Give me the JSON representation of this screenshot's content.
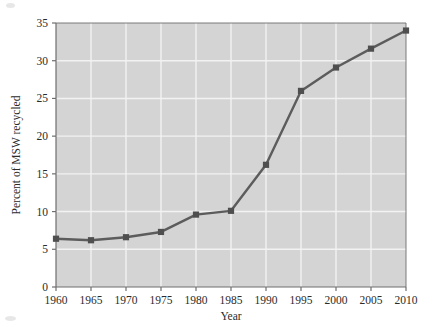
{
  "chart_data": {
    "type": "line",
    "title": "",
    "subtitle": "",
    "xlabel": "Year",
    "ylabel": "Percent of MSW recycled",
    "x": [
      1960,
      1965,
      1970,
      1975,
      1980,
      1985,
      1990,
      1995,
      2000,
      2005,
      2010
    ],
    "values": [
      6.4,
      6.2,
      6.6,
      7.3,
      9.6,
      10.1,
      16.2,
      26.0,
      29.1,
      31.6,
      34.0
    ],
    "series": [
      {
        "name": "Percent of MSW recycled",
        "values": [
          6.4,
          6.2,
          6.6,
          7.3,
          9.6,
          10.1,
          16.2,
          26.0,
          29.1,
          31.6,
          34.0
        ]
      }
    ],
    "categories": [
      "1960",
      "1965",
      "1970",
      "1975",
      "1980",
      "1985",
      "1990",
      "1995",
      "2000",
      "2005",
      "2010"
    ],
    "xlim": [
      1960,
      2010
    ],
    "ylim": [
      0,
      35
    ],
    "xticks": [
      1960,
      1965,
      1970,
      1975,
      1980,
      1985,
      1990,
      1995,
      2000,
      2005,
      2010
    ],
    "yticks": [
      0,
      5,
      10,
      15,
      20,
      25,
      30,
      35
    ],
    "xtick_labels": [
      "1960",
      "1965",
      "1970",
      "1975",
      "1980",
      "1985",
      "1990",
      "1995",
      "2000",
      "2005",
      "2010"
    ],
    "ytick_labels": [
      "0",
      "5",
      "10",
      "15",
      "20",
      "25",
      "30",
      "35"
    ],
    "grid": true,
    "grid_axis": "both",
    "legend": false,
    "legend_position": "none",
    "marker": "square",
    "annotations": []
  },
  "style": {
    "plot_background": "#d4d4d4",
    "page_background": "#ffffff",
    "grid_color": "#f2f2f2",
    "line_color": "#5c5c5c",
    "marker_color": "#4f4f4f",
    "axis_color": "#6e6e6e",
    "text_color": "#2b2b2b"
  }
}
